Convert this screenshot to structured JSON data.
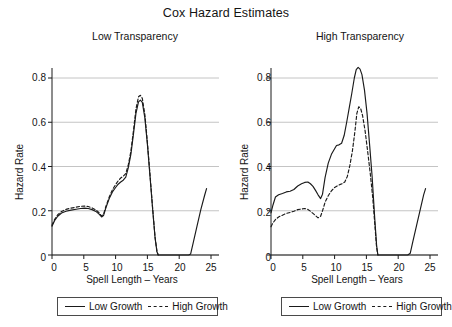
{
  "figure": {
    "title": "Cox Hazard Estimates"
  },
  "legend": {
    "entries": [
      {
        "label": "Low Growth",
        "style": "solid",
        "icon": "solid-line-icon"
      },
      {
        "label": "High Growth",
        "style": "dashed",
        "icon": "dashed-line-icon"
      }
    ]
  },
  "panels": [
    {
      "title": "Low Transparency"
    },
    {
      "title": "High Transparency"
    }
  ],
  "axes": {
    "xlabel": "Spell Length – Years",
    "ylabel": "Hazard Rate",
    "xticks": [
      "0",
      "5",
      "10",
      "15",
      "20",
      "25"
    ],
    "yticks": [
      "0",
      "0.2",
      "0.4",
      "0.6",
      "0.8"
    ]
  },
  "chart_data": {
    "type": "line",
    "title": "Cox Hazard Estimates",
    "xlabel": "Spell Length – Years",
    "ylabel": "Hazard Rate",
    "xlim": [
      0,
      25
    ],
    "ylim": [
      0,
      0.88
    ],
    "xticks": [
      0,
      5,
      10,
      15,
      20,
      25
    ],
    "yticks": [
      0,
      0.2,
      0.4,
      0.6,
      0.8
    ],
    "grid": "horizontal",
    "legend_position": "below-each-panel",
    "panels": [
      {
        "title": "Low Transparency",
        "series": [
          {
            "name": "Low Growth",
            "style": "solid",
            "x": [
              0.0,
              0.4,
              0.9,
              1.5,
              2.2,
              3.0,
              3.8,
              4.5,
              5.1,
              5.7,
              6.3,
              6.9,
              7.4,
              7.8,
              8.1,
              8.5,
              9.0,
              9.5,
              10.0,
              10.4,
              10.8,
              11.2,
              11.6,
              12.0,
              12.4,
              12.8,
              13.2,
              13.6,
              13.9,
              14.2,
              14.6,
              15.0,
              15.4,
              15.8,
              16.2,
              16.5,
              16.7,
              17.5,
              19.0,
              20.5,
              21.5,
              21.8,
              22.2,
              22.8,
              23.4,
              24.0,
              24.3
            ],
            "y": [
              0.13,
              0.155,
              0.175,
              0.19,
              0.198,
              0.203,
              0.207,
              0.21,
              0.212,
              0.21,
              0.205,
              0.197,
              0.185,
              0.172,
              0.178,
              0.215,
              0.255,
              0.285,
              0.305,
              0.32,
              0.33,
              0.338,
              0.352,
              0.395,
              0.455,
              0.545,
              0.64,
              0.692,
              0.7,
              0.69,
              0.62,
              0.5,
              0.36,
              0.215,
              0.08,
              0.015,
              0.0,
              0.0,
              0.0,
              0.0,
              0.0,
              0.005,
              0.055,
              0.13,
              0.205,
              0.27,
              0.3
            ]
          },
          {
            "name": "High Growth",
            "style": "dashed",
            "x": [
              0.0,
              0.4,
              0.9,
              1.5,
              2.2,
              3.0,
              3.8,
              4.5,
              5.1,
              5.7,
              6.3,
              6.9,
              7.4,
              7.8,
              8.1,
              8.5,
              9.0,
              9.5,
              10.0,
              10.4,
              10.8,
              11.2,
              11.6,
              12.0,
              12.4,
              12.8,
              13.2,
              13.6,
              13.9,
              14.2,
              14.6,
              15.0,
              15.4,
              15.8,
              16.2,
              16.5,
              16.7
            ],
            "y": [
              0.135,
              0.16,
              0.182,
              0.197,
              0.206,
              0.212,
              0.216,
              0.22,
              0.221,
              0.219,
              0.213,
              0.204,
              0.191,
              0.176,
              0.184,
              0.222,
              0.262,
              0.295,
              0.318,
              0.335,
              0.348,
              0.356,
              0.368,
              0.408,
              0.468,
              0.56,
              0.66,
              0.715,
              0.722,
              0.708,
              0.635,
              0.51,
              0.368,
              0.22,
              0.082,
              0.016,
              0.0
            ]
          }
        ]
      },
      {
        "title": "High Transparency",
        "series": [
          {
            "name": "Low Growth",
            "style": "solid",
            "x": [
              0.0,
              0.3,
              0.7,
              1.2,
              1.8,
              2.4,
              3.0,
              3.6,
              4.2,
              4.8,
              5.3,
              5.8,
              6.2,
              6.6,
              7.0,
              7.4,
              7.8,
              8.1,
              8.5,
              9.0,
              9.5,
              10.0,
              10.3,
              10.7,
              11.1,
              11.5,
              11.9,
              12.3,
              12.7,
              13.1,
              13.4,
              13.7,
              14.0,
              14.3,
              14.7,
              15.1,
              15.5,
              15.9,
              16.3,
              16.6,
              16.8,
              17.5,
              19.0,
              20.5,
              21.5,
              21.9,
              22.3,
              22.9,
              23.5,
              24.0,
              24.3
            ],
            "y": [
              0.19,
              0.225,
              0.262,
              0.272,
              0.278,
              0.285,
              0.288,
              0.296,
              0.312,
              0.322,
              0.328,
              0.33,
              0.322,
              0.31,
              0.292,
              0.272,
              0.255,
              0.275,
              0.35,
              0.415,
              0.455,
              0.48,
              0.495,
              0.498,
              0.505,
              0.54,
              0.6,
              0.665,
              0.73,
              0.8,
              0.838,
              0.848,
              0.84,
              0.815,
              0.745,
              0.64,
              0.5,
              0.355,
              0.17,
              0.045,
              0.0,
              0.0,
              0.0,
              0.0,
              0.0,
              0.008,
              0.06,
              0.135,
              0.21,
              0.272,
              0.3
            ]
          },
          {
            "name": "High Growth",
            "style": "dashed",
            "x": [
              0.0,
              0.3,
              0.7,
              1.2,
              1.8,
              2.4,
              3.0,
              3.6,
              4.2,
              4.8,
              5.3,
              5.8,
              6.2,
              6.6,
              7.0,
              7.4,
              7.8,
              8.1,
              8.5,
              9.0,
              9.5,
              10.0,
              10.4,
              10.8,
              11.2,
              11.6,
              12.0,
              12.4,
              12.8,
              13.2,
              13.5,
              13.8,
              14.1,
              14.4,
              14.8,
              15.2,
              15.6,
              16.0,
              16.4,
              16.6,
              16.8
            ],
            "y": [
              0.128,
              0.145,
              0.16,
              0.172,
              0.18,
              0.188,
              0.192,
              0.198,
              0.205,
              0.208,
              0.21,
              0.206,
              0.198,
              0.188,
              0.178,
              0.168,
              0.175,
              0.2,
              0.238,
              0.268,
              0.29,
              0.305,
              0.312,
              0.318,
              0.322,
              0.33,
              0.355,
              0.405,
              0.47,
              0.56,
              0.64,
              0.67,
              0.662,
              0.63,
              0.56,
              0.468,
              0.37,
              0.258,
              0.11,
              0.035,
              0.0
            ]
          }
        ]
      }
    ]
  }
}
